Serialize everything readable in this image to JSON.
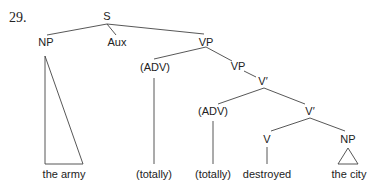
{
  "example_number": "29.",
  "nodes": {
    "s": "S",
    "np_subject": "NP",
    "aux": "Aux",
    "vp_outer": "VP",
    "adv_outer": "(ADV)",
    "vp_inner": "VP",
    "vbar_outer": "V′",
    "adv_inner": "(ADV)",
    "vbar_inner": "V′",
    "v": "V",
    "np_object": "NP"
  },
  "leaves": {
    "subject": "the army",
    "adv_outer": "(totally)",
    "adv_inner": "(totally)",
    "verb": "destroyed",
    "object": "the city"
  }
}
